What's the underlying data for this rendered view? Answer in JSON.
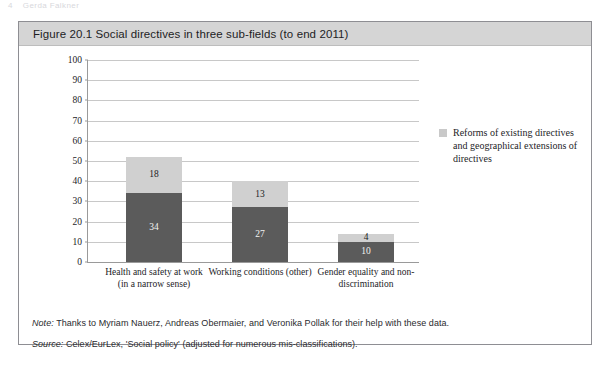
{
  "page_header": {
    "page_number": "4",
    "running_head": "Gerda Falkner"
  },
  "figure": {
    "title": "Figure 20.1  Social directives in three sub-fields (to end 2011)",
    "note_prefix": "Note:",
    "note_text": " Thanks to Myriam Nauerz, Andreas Obermaier, and Veronika Pollak for their help with these data.",
    "source_prefix": "Source:",
    "source_text": " Celex/EurLex, 'Social policy' (adjusted for numerous mis-classifications)."
  },
  "legend": {
    "entries": [
      {
        "label": "Reforms of existing directives and geographical extensions of directives",
        "color": "#c9c9c9"
      }
    ]
  },
  "colors": {
    "bar_bottom": "#5b5b5b",
    "bar_top": "#d0d0d0",
    "gridline": "#c8c8c8",
    "axis": "#9a9a9a",
    "title_band": "#d5d5d5",
    "box_border": "#8e8e93"
  },
  "chart_data": {
    "type": "bar",
    "subtype": "stacked",
    "title": "Figure 20.1  Social directives in three sub-fields (to end 2011)",
    "xlabel": "",
    "ylabel": "",
    "ylim": [
      0,
      100
    ],
    "yticks": [
      0,
      10,
      20,
      30,
      40,
      50,
      60,
      70,
      80,
      90,
      100
    ],
    "ytick_labels": [
      "0",
      "10",
      "20",
      "30",
      "40",
      "50",
      "60",
      "70",
      "80",
      "90",
      "100"
    ],
    "grid": "horizontal",
    "legend_position": "right",
    "categories": [
      "Health and safety at work (in a narrow sense)",
      "Working conditions (other)",
      "Gender equality and non-discrimination"
    ],
    "category_lines": [
      [
        "Health and safety at work",
        "(in a narrow sense)"
      ],
      [
        "Working conditions (other)",
        ""
      ],
      [
        "Gender equality and non-",
        "discrimination"
      ]
    ],
    "series": [
      {
        "name": "New directives",
        "color": "#5b5b5b",
        "values": [
          34,
          27,
          10
        ]
      },
      {
        "name": "Reforms of existing directives and geographical extensions of directives",
        "color": "#d0d0d0",
        "values": [
          18,
          13,
          4
        ]
      }
    ],
    "totals": [
      52,
      40,
      14
    ]
  }
}
